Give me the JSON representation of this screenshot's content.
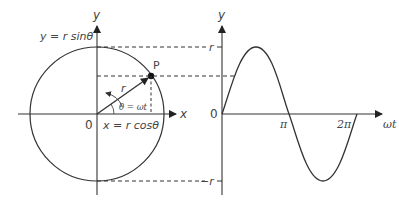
{
  "colors": {
    "stroke": "#333333",
    "label": "#444444",
    "background": "#ffffff"
  },
  "circle_diagram": {
    "y_axis_label": "y",
    "x_axis_label": "x",
    "origin_label": "0",
    "y_projection_label": "y = r sinθ",
    "x_projection_label": "x = r cosθ",
    "point_label": "P",
    "radius_label": "r",
    "angle_label": "θ = ωt"
  },
  "wave_graph": {
    "y_axis_label": "y",
    "x_axis_label": "ωt",
    "origin_label": "0",
    "y_max_label": "r",
    "y_min_label": "−r",
    "x_tick_labels": [
      "π",
      "2π"
    ]
  }
}
